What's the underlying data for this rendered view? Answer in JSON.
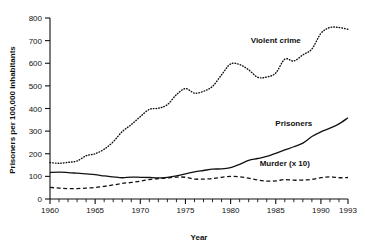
{
  "chart_data": {
    "type": "line",
    "title": "",
    "xlabel": "Year",
    "ylabel": "Prisoners per 100,000 inhabitants",
    "xlim": [
      1960,
      1993
    ],
    "ylim": [
      0,
      800
    ],
    "grid": false,
    "legend_position": "inline-annotations",
    "x_tick_labels": [
      "1960",
      "1965",
      "1970",
      "1975",
      "1980",
      "1985",
      "1990",
      "1993"
    ],
    "x_tick_values": [
      1960,
      1965,
      1970,
      1975,
      1980,
      1985,
      1990,
      1993
    ],
    "x_minor_tick_step": 1,
    "y_tick_labels": [
      "0",
      "100",
      "200",
      "300",
      "400",
      "500",
      "600",
      "700",
      "800"
    ],
    "y_tick_values": [
      0,
      100,
      200,
      300,
      400,
      500,
      600,
      700,
      800
    ],
    "x": [
      1960,
      1961,
      1962,
      1963,
      1964,
      1965,
      1966,
      1967,
      1968,
      1969,
      1970,
      1971,
      1972,
      1973,
      1974,
      1975,
      1976,
      1977,
      1978,
      1979,
      1980,
      1981,
      1982,
      1983,
      1984,
      1985,
      1986,
      1987,
      1988,
      1989,
      1990,
      1991,
      1992,
      1993
    ],
    "series": [
      {
        "name": "Violent crime",
        "style": "dotted",
        "color": "#111111",
        "label_x": 1985,
        "label_y": 690,
        "values": [
          161,
          158,
          162,
          168,
          191,
          200,
          220,
          253,
          298,
          329,
          364,
          396,
          401,
          417,
          461,
          488,
          468,
          476,
          498,
          549,
          597,
          594,
          571,
          538,
          539,
          557,
          618,
          610,
          637,
          663,
          732,
          758,
          758,
          750
        ]
      },
      {
        "name": "Prisoners",
        "style": "solid",
        "color": "#111111",
        "label_x": 1987,
        "label_y": 322,
        "values": [
          117,
          119,
          117,
          114,
          111,
          108,
          102,
          98,
          94,
          97,
          96,
          95,
          93,
          96,
          102,
          111,
          120,
          126,
          132,
          133,
          139,
          153,
          171,
          179,
          188,
          202,
          217,
          231,
          247,
          276,
          297,
          313,
          332,
          359
        ]
      },
      {
        "name": "Murder (x 10)",
        "style": "dashed",
        "color": "#111111",
        "label_x": 1986,
        "label_y": 148,
        "values": [
          51,
          48,
          46,
          46,
          48,
          51,
          56,
          62,
          69,
          73,
          79,
          86,
          90,
          93,
          97,
          96,
          88,
          88,
          90,
          96,
          100,
          98,
          92,
          84,
          79,
          80,
          86,
          83,
          84,
          87,
          94,
          98,
          94,
          95
        ]
      }
    ]
  },
  "axes": {
    "y_axis_title": "Prisoners per 100,000 inhabitants",
    "x_axis_title": "Year"
  }
}
